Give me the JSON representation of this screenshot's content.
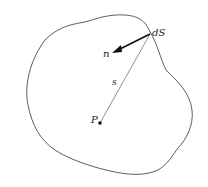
{
  "diagram": {
    "labels": {
      "surface_element": "dS",
      "normal": "n",
      "distance": "s",
      "point": "P"
    },
    "colors": {
      "outline": "#333333",
      "text": "#222222",
      "background": "#ffffff"
    }
  }
}
